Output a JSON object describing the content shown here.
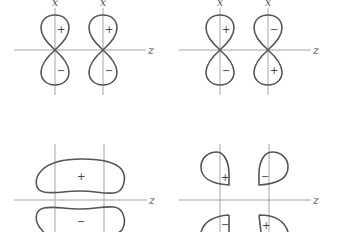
{
  "colors": {
    "axis": "#9a9a9a",
    "lobe_outline": "#555555",
    "text": "#444444",
    "background": "#ffffff"
  },
  "panels": [
    {
      "id": "top-left",
      "description": "Two p_x orbitals aligned along z, same phase (bonding pi)",
      "axis_labels": {
        "vertical_1": "x",
        "vertical_2": "x",
        "horizontal": "z"
      },
      "signs": {
        "left_upper": "+",
        "left_lower": "−",
        "right_upper": "+",
        "right_lower": "−"
      }
    },
    {
      "id": "top-right",
      "description": "Two p_x orbitals aligned along z, opposite phase (antibonding pi*)",
      "axis_labels": {
        "vertical_1": "x",
        "vertical_2": "x",
        "horizontal": "z"
      },
      "signs": {
        "left_upper": "+",
        "left_lower": "−",
        "right_upper": "−",
        "right_lower": "+"
      }
    },
    {
      "id": "bottom-left",
      "description": "Bonding pi molecular orbital",
      "axis_labels": {
        "horizontal": "z"
      },
      "signs": {
        "upper": "+",
        "lower": "−"
      }
    },
    {
      "id": "bottom-right",
      "description": "Antibonding pi* molecular orbital",
      "axis_labels": {
        "horizontal": "z"
      },
      "signs": {
        "upper_left": "+",
        "upper_right": "−",
        "lower_left": "−",
        "lower_right": "+"
      }
    }
  ]
}
